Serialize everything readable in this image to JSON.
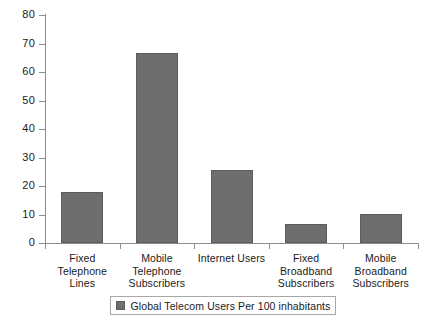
{
  "chart_data": {
    "type": "bar",
    "title": "",
    "subtitle": "",
    "xlabel": "",
    "ylabel": "",
    "ylim": [
      0,
      80
    ],
    "ytick_step": 10,
    "yticks": [
      80,
      70,
      60,
      50,
      40,
      30,
      20,
      10,
      0
    ],
    "grid": false,
    "legend_position": "bottom-center",
    "legend": [
      "Global Telecom Users Per 100 inhabitants"
    ],
    "categories": [
      "Fixed\nTelephone\nLines",
      "Mobile\nTelephone\nSubscribers",
      "Internet Users",
      "Fixed\nBroadband\nSubscribers",
      "Mobile\nBroadband\nSubscribers"
    ],
    "series": [
      {
        "name": "Global Telecom Users Per 100 inhabitants",
        "color": "#6E6E6E",
        "values": [
          18,
          66.7,
          25.6,
          6.7,
          10.2
        ]
      }
    ]
  },
  "legend": {
    "swatch_color": "#6E6E6E",
    "label": "Global Telecom Users Per 100 inhabitants"
  },
  "colors": {
    "bar_fill": "#6E6E6E",
    "bar_border": "#5C5C5C",
    "axis": "#8D8D8D",
    "text": "#1A1A1A",
    "background": "#FFFFFF"
  }
}
